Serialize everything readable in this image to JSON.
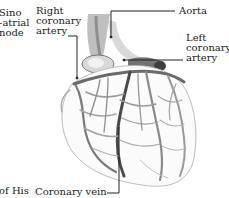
{
  "diagram": {
    "labels": {
      "sinoatrial_node": [
        "Sino",
        "-atrial",
        "node"
      ],
      "right_coronary_artery": [
        "Right",
        "coronary",
        "artery"
      ],
      "aorta": [
        "Aorta"
      ],
      "left_coronary_artery": [
        "Left",
        "coronary",
        "artery"
      ],
      "bundle_of_his": [
        "of His"
      ],
      "coronary_vein": [
        "Coronary vein"
      ]
    },
    "colors": {
      "background": "#ffffff",
      "text": "#1c1c1c",
      "leader_line": "#222222",
      "vessel_dark": "#4a4a4a",
      "vessel_mid": "#8a8a8a",
      "vessel_light": "#c4c4c4"
    }
  }
}
